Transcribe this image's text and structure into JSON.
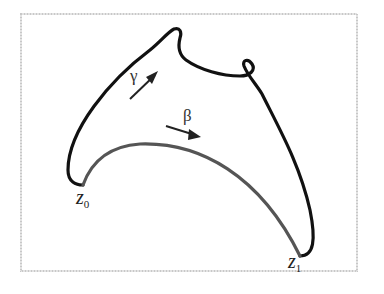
{
  "diagram": {
    "colors": {
      "frame": "#c8c8c8",
      "gamma_curve": "#111111",
      "beta_curve": "#555555",
      "arrows": "#222222"
    },
    "labels": {
      "gamma": "γ",
      "beta": "β",
      "z0_base": "z",
      "z0_sub": "0",
      "z1_base": "z",
      "z1_sub": "1"
    },
    "curves": [
      {
        "name": "gamma",
        "description": "black curve from z0 to z1 over top with a small loop"
      },
      {
        "name": "beta",
        "description": "grey arc from z0 to z1"
      }
    ]
  }
}
